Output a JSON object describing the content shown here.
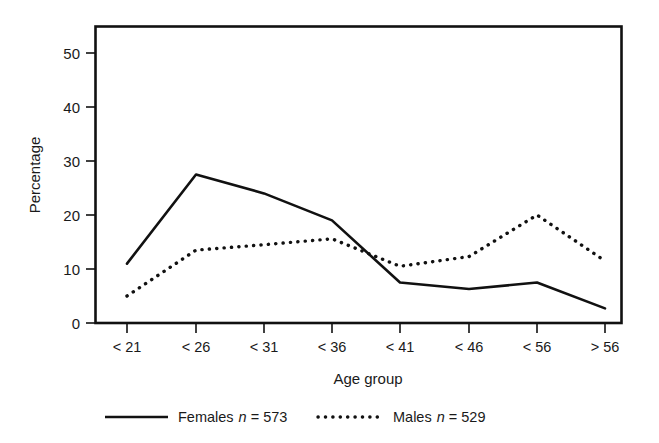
{
  "chart_data": {
    "type": "line",
    "title": "",
    "xlabel": "Age group",
    "ylabel": "Percentage",
    "categories": [
      "< 21",
      "< 26",
      "< 31",
      "< 36",
      "< 41",
      "< 46",
      "< 56",
      "> 56"
    ],
    "series": [
      {
        "name": "Females",
        "legend_label": "Females n = 573",
        "n": 573,
        "style": "solid",
        "color": "#111111",
        "values": [
          11,
          27.5,
          24,
          19,
          7.5,
          6.3,
          7.5,
          2.7
        ]
      },
      {
        "name": "Males",
        "legend_label": "Males n = 529",
        "n": 529,
        "style": "dotted",
        "color": "#111111",
        "values": [
          5,
          13.5,
          14.5,
          15.6,
          10.5,
          12.3,
          20,
          11.5
        ]
      }
    ],
    "ylim": [
      0,
      55
    ],
    "yticks": [
      0,
      10,
      20,
      30,
      40,
      50
    ],
    "ytick_labels": [
      "0",
      "10",
      "20",
      "30",
      "40",
      "50"
    ],
    "grid": false,
    "legend_position": "bottom"
  },
  "axes": {
    "y_title": "Percentage",
    "x_title": "Age group"
  },
  "legend": {
    "entries": [
      {
        "label_main": "Females",
        "var": "n",
        "eq": "= 573",
        "style": "solid"
      },
      {
        "label_main": "Males",
        "var": "n",
        "eq": "= 529",
        "style": "dotted"
      }
    ]
  }
}
